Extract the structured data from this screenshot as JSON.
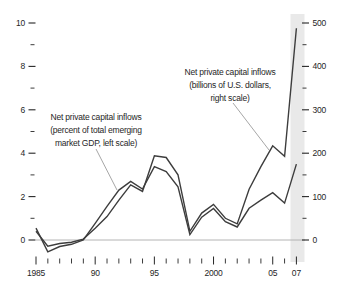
{
  "chart_data": {
    "type": "line",
    "x": [
      1985,
      1986,
      1987,
      1988,
      1989,
      1990,
      1991,
      1992,
      1993,
      1994,
      1995,
      1996,
      1997,
      1998,
      1999,
      2000,
      2001,
      2002,
      2003,
      2004,
      2005,
      2006,
      2007
    ],
    "series": [
      {
        "name": "Net private capital inflows (percent of total emerging market GDP, left scale)",
        "axis": "left",
        "values": [
          0.55,
          -0.55,
          -0.3,
          -0.2,
          0,
          0.77,
          1.55,
          2.3,
          2.7,
          2.35,
          3.38,
          3.15,
          2.45,
          0.25,
          1.05,
          1.45,
          0.85,
          0.6,
          1.46,
          1.84,
          2.18,
          1.7,
          3.5
        ]
      },
      {
        "name": "Net private capital inflows (billions of U.S. dollars, right scale)",
        "axis": "right",
        "values": [
          20,
          -14,
          -8,
          -5,
          2,
          27,
          54,
          92,
          127,
          112,
          194,
          190,
          150,
          20,
          62,
          82,
          50,
          37,
          117,
          169,
          217,
          193,
          488
        ]
      }
    ],
    "left_axis": {
      "range": [
        0,
        10
      ],
      "ticks": [
        0,
        2,
        4,
        6,
        8,
        10
      ],
      "tick_labels": [
        "0",
        "2",
        "4",
        "6",
        "8",
        "10"
      ],
      "minor_ticks": [
        1,
        3,
        5,
        7,
        9
      ]
    },
    "right_axis": {
      "range": [
        0,
        500
      ],
      "ticks": [
        0,
        100,
        200,
        300,
        400,
        500
      ],
      "tick_labels": [
        "0",
        "100",
        "200",
        "300",
        "400",
        "500"
      ],
      "minor_ticks": [
        50,
        150,
        250,
        350,
        450
      ]
    },
    "x_axis": {
      "range": [
        1985,
        2007
      ],
      "major_ticks": [
        1985,
        1990,
        1995,
        2000,
        2005,
        2007
      ],
      "tick_labels": [
        "1985",
        "90",
        "95",
        "2000",
        "05",
        "07"
      ],
      "minor_ticks": [
        1986,
        1987,
        1988,
        1989,
        1991,
        1992,
        1993,
        1994,
        1996,
        1997,
        1998,
        1999,
        2001,
        2002,
        2003,
        2004,
        2006
      ]
    },
    "highlight_band": {
      "year": 2007
    },
    "grid": "zero-line-only",
    "legend_position": "in-plot annotations with callout lines"
  },
  "annotations": [
    {
      "lines": [
        "Net private capital inflows",
        "(percent of total emerging",
        "market GDP, left scale)"
      ]
    },
    {
      "lines": [
        "Net private capital inflows",
        "(billions of U.S. dollars,",
        "right scale)"
      ]
    }
  ],
  "colors": {
    "line": "#3d3d3d",
    "zero_line": "#ababab",
    "band": "#e9e9e9",
    "text": "#262626",
    "tick": "#262626",
    "callout": "#8f8f8f",
    "background": "#ffffff"
  }
}
